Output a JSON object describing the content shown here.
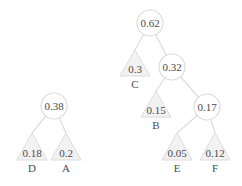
{
  "diagram": {
    "colors": {
      "edge": "#dcdcdc",
      "circle_fill": "#ffffff",
      "circle_stroke": "#dcdcdc",
      "leaf_fill": "#f2f2f2",
      "text": "#4a4a4a"
    },
    "internal_nodes": [
      {
        "id": "n038",
        "value": "0.38",
        "x": 54,
        "y": 106,
        "r": 13
      },
      {
        "id": "n062",
        "value": "0.62",
        "x": 150,
        "y": 23,
        "r": 13
      },
      {
        "id": "n032",
        "value": "0.32",
        "x": 172,
        "y": 67,
        "r": 13
      },
      {
        "id": "n017",
        "value": "0.17",
        "x": 207,
        "y": 107,
        "r": 13
      }
    ],
    "leaves": [
      {
        "id": "D",
        "value": "0.18",
        "label": "D",
        "x": 32,
        "apex_y": 133,
        "base_y": 160,
        "half_w": 15
      },
      {
        "id": "A",
        "value": "0.2",
        "label": "A",
        "x": 66,
        "apex_y": 133,
        "base_y": 160,
        "half_w": 15
      },
      {
        "id": "C",
        "value": "0.3",
        "label": "C",
        "x": 135,
        "apex_y": 50,
        "base_y": 76,
        "half_w": 15
      },
      {
        "id": "B",
        "value": "0.15",
        "label": "B",
        "x": 156,
        "apex_y": 91,
        "base_y": 117,
        "half_w": 15
      },
      {
        "id": "E",
        "value": "0.05",
        "label": "E",
        "x": 177,
        "apex_y": 133,
        "base_y": 160,
        "half_w": 15
      },
      {
        "id": "F",
        "value": "0.12",
        "label": "F",
        "x": 215,
        "apex_y": 133,
        "base_y": 160,
        "half_w": 15
      }
    ],
    "edges": [
      {
        "from": "n038",
        "to": "D"
      },
      {
        "from": "n038",
        "to": "A"
      },
      {
        "from": "n062",
        "to": "C"
      },
      {
        "from": "n062",
        "to": "n032"
      },
      {
        "from": "n032",
        "to": "B"
      },
      {
        "from": "n032",
        "to": "n017"
      },
      {
        "from": "n017",
        "to": "E"
      },
      {
        "from": "n017",
        "to": "F"
      }
    ]
  }
}
